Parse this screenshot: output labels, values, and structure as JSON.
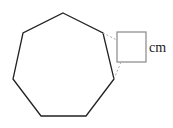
{
  "diagram": {
    "shapes": [
      {
        "type": "heptagon",
        "points": "63,13 103,33 114,79 86,116 41,116 13,79 23,33",
        "stroke": "#222222"
      },
      {
        "type": "square",
        "x": 117,
        "y": 32,
        "size": 29,
        "stroke": "#888888"
      }
    ],
    "unit_label": "cm",
    "colors": {
      "heptagon_stroke": "#222222",
      "square_stroke": "#888888",
      "dashed": "#aaaaaa"
    }
  }
}
